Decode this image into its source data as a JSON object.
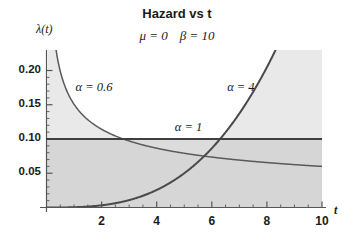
{
  "chart_data": {
    "type": "line",
    "title": "Hazard vs t",
    "subtitle": "μ = 0   β = 10",
    "params": {
      "mu_label": "μ = 0",
      "beta_label": "β = 10",
      "mu": 0,
      "beta": 10
    },
    "xlabel": "t",
    "ylabel": "λ(t)",
    "xlim": [
      0,
      10
    ],
    "ylim": [
      0,
      0.21
    ],
    "grid": false,
    "legend_position": "inline-annotations",
    "xticks": [
      2,
      4,
      6,
      8,
      10
    ],
    "xtick_labels": [
      "2",
      "4",
      "6",
      "8",
      "10"
    ],
    "yticks": [
      0.05,
      0.1,
      0.15,
      0.2
    ],
    "ytick_labels": [
      "0.05",
      "0.10",
      "0.15",
      "0.20"
    ],
    "series": [
      {
        "name": "α = 0.6",
        "alpha": 0.6,
        "annotation": "α = 0.6",
        "x": [
          0.3,
          0.5,
          0.75,
          1,
          1.5,
          2,
          2.5,
          3,
          3.5,
          4,
          4.5,
          5,
          5.5,
          6,
          6.5,
          7,
          7.5,
          8,
          8.5,
          9,
          9.5,
          10
        ],
        "values": [
          0.2682,
          0.2121,
          0.1775,
          0.157,
          0.1315,
          0.1163,
          0.1059,
          0.0981,
          0.0921,
          0.0872,
          0.0831,
          0.0797,
          0.0767,
          0.074,
          0.0717,
          0.0696,
          0.0677,
          0.066,
          0.0644,
          0.063,
          0.0616,
          0.0604
        ]
      },
      {
        "name": "α = 1",
        "alpha": 1,
        "annotation": "α = 1",
        "x": [
          0,
          10
        ],
        "values": [
          0.1,
          0.1
        ]
      },
      {
        "name": "α = 4",
        "alpha": 4,
        "annotation": "α = 4",
        "x": [
          0,
          1,
          2,
          3,
          4,
          5,
          6,
          7,
          8,
          8.4,
          9,
          10
        ],
        "values": [
          0.0,
          0.0004,
          0.0032,
          0.0108,
          0.0256,
          0.05,
          0.0864,
          0.1372,
          0.2048,
          0.237,
          0.2916,
          0.4
        ]
      }
    ],
    "annotations": [
      {
        "text": "α = 0.6",
        "x": 2.0,
        "y": 0.173
      },
      {
        "text": "α = 1",
        "x": 5.6,
        "y": 0.115
      },
      {
        "text": "α = 4",
        "x": 7.5,
        "y": 0.173
      }
    ],
    "colors": {
      "curve": "#4a4a4a",
      "axis": "#555555",
      "text": "#1a1a1a",
      "fill_light": "#e6e6e6",
      "fill_mid": "#d8d8d8",
      "fill_dark": "#bfbfbf",
      "background": "#ffffff"
    }
  }
}
